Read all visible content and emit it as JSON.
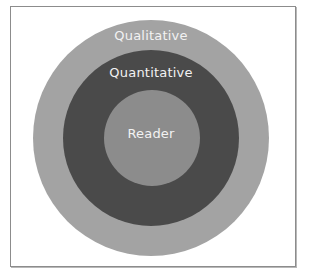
{
  "diagram": {
    "type": "concentric-circles",
    "rings": [
      {
        "label": "Qualitative",
        "color": "#a3a3a3"
      },
      {
        "label": "Quantitative",
        "color": "#4a4a4a"
      },
      {
        "label": "Reader",
        "color": "#8c8c8c"
      }
    ]
  }
}
